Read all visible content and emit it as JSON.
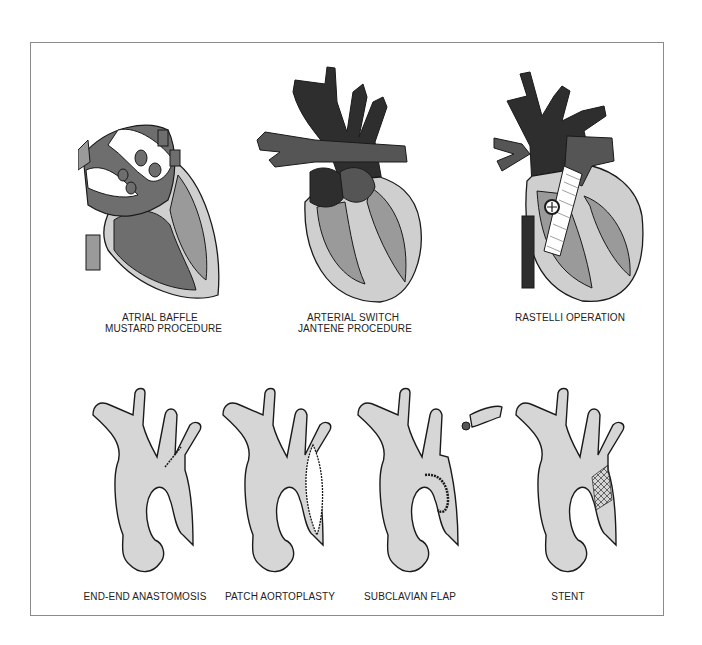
{
  "figure": {
    "top_row": [
      {
        "label_line1": "ATRIAL BAFFLE",
        "label_line2": "MUSTARD PROCEDURE",
        "icon": "heart-atrial-baffle-illustration"
      },
      {
        "label_line1": "ARTERIAL SWITCH",
        "label_line2": "JANTENE PROCEDURE",
        "icon": "heart-arterial-switch-illustration"
      },
      {
        "label_line1": "RASTELLI OPERATION",
        "label_line2": "",
        "icon": "heart-rastelli-conduit-illustration"
      }
    ],
    "bottom_row": [
      {
        "label": "END-END ANASTOMOSIS",
        "icon": "aorta-end-end-anastomosis-illustration"
      },
      {
        "label": "PATCH AORTOPLASTY",
        "icon": "aorta-patch-illustration"
      },
      {
        "label": "SUBCLAVIAN FLAP",
        "icon": "aorta-subclavian-flap-illustration"
      },
      {
        "label": "STENT",
        "icon": "aorta-stent-illustration"
      }
    ],
    "colors": {
      "frame": "#8a8a8a",
      "outline": "#1a1a1a",
      "vessel_dark": "#2e2e2e",
      "vessel_mid": "#555555",
      "chamber_dark": "#6e6e6e",
      "chamber_mid": "#9a9a9a",
      "myocardium": "#cfcfcf",
      "aorta_fill": "#d6d6d6"
    }
  }
}
